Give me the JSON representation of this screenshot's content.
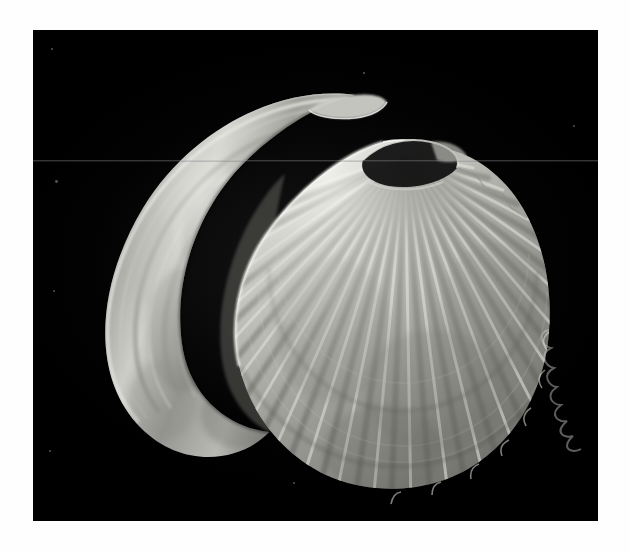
{
  "page": {
    "background_color": "#ffffff",
    "border_color": "#fefefe"
  },
  "plate": {
    "label": "x-ray-plate",
    "background_color": "#000000",
    "left": 33,
    "top": 30,
    "width": 565,
    "height": 491,
    "film_fog_color": "#28282a",
    "artifact": {
      "name": "horizontal-scan-line",
      "y": 130,
      "color": "#a0a0a5"
    }
  },
  "subjects": [
    {
      "id": "crescent-shell",
      "name": "Curved crescent bivalve shell (edge view)",
      "position": "left",
      "description": "Thick crescent / hook shaped shell curving from upper right tip down and around to the lower left, showing concentric growth bands.",
      "tone_light": "#d8d8d4",
      "tone_mid": "#9a9a96",
      "tone_dark": "#4a4a48",
      "bands": 7
    },
    {
      "id": "scallop-shell",
      "name": "Scallop shell (fan, radial ribs)",
      "position": "right",
      "description": "Fan-shaped scallop with radiating ribs from the hinge at upper left, scalloped lobed margin at the right and lower edge, and a dark oval auricle/hinge opening.",
      "tone_light": "#e2e2de",
      "tone_mid": "#a8a8a2",
      "tone_dark": "#5c5c58",
      "ribs": 24,
      "hinge": {
        "name": "hinge-auricle-opening",
        "shape": "dark-oval",
        "color": "#111111"
      }
    }
  ],
  "specks": [
    {
      "x": 18,
      "y": 18,
      "r": 1.2
    },
    {
      "x": 22,
      "y": 150,
      "r": 1.4
    },
    {
      "x": 20,
      "y": 260,
      "r": 1.1
    },
    {
      "x": 16,
      "y": 420,
      "r": 1.0
    },
    {
      "x": 105,
      "y": 560,
      "r": 1.2
    },
    {
      "x": 330,
      "y": 42,
      "r": 0.9
    },
    {
      "x": 540,
      "y": 95,
      "r": 1.0
    },
    {
      "x": 260,
      "y": 452,
      "r": 1.0
    }
  ]
}
